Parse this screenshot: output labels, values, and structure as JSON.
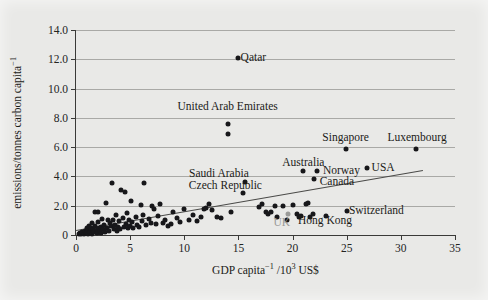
{
  "chart_data": {
    "type": "scatter",
    "title": "",
    "xlabel": "GDP capita⁻¹ /10³ US$",
    "ylabel": "emissions/tonnes carbon capita⁻¹",
    "xlim": [
      0,
      35
    ],
    "ylim": [
      0,
      14
    ],
    "xticks": [
      0,
      5,
      10,
      15,
      20,
      25,
      30,
      35
    ],
    "xtick_labels": [
      "0",
      "5",
      "10",
      "15",
      "20",
      "25",
      "30",
      "35"
    ],
    "yticks": [
      0,
      2,
      4,
      6,
      8,
      10,
      12,
      14
    ],
    "ytick_labels": [
      "0",
      "2.0",
      "4.0",
      "6.0",
      "8.0",
      "10.0",
      "12.0",
      "14.0"
    ],
    "grid": "horizontal",
    "legend": "none",
    "point_color": "#17171a",
    "highlight_color": "#9a9a98",
    "trendline": {
      "x": [
        0,
        32
      ],
      "y": [
        0.35,
        4.45
      ],
      "color": "#4a4a48"
    },
    "annotations": [
      {
        "label": "Qatar",
        "x": 15.2,
        "y": 12.1,
        "anchor": "left"
      },
      {
        "label": "United Arab Emirates",
        "x": 14.0,
        "y": 8.75,
        "anchor": "center"
      },
      {
        "label": "Singapore",
        "x": 24.9,
        "y": 6.6,
        "anchor": "center"
      },
      {
        "label": "Luxembourg",
        "x": 31.5,
        "y": 6.65,
        "anchor": "center"
      },
      {
        "label": "Australia",
        "x": 21.0,
        "y": 4.95,
        "anchor": "center"
      },
      {
        "label": "Norway",
        "x": 22.8,
        "y": 4.35,
        "anchor": "left"
      },
      {
        "label": "USA",
        "x": 27.3,
        "y": 4.6,
        "anchor": "left"
      },
      {
        "label": "Saudi Arabia",
        "x": 13.2,
        "y": 4.15,
        "anchor": "center"
      },
      {
        "label": "Canada",
        "x": 22.5,
        "y": 3.6,
        "anchor": "left"
      },
      {
        "label": "Czech Republic",
        "x": 13.8,
        "y": 3.35,
        "anchor": "center"
      },
      {
        "label": "Switzerland",
        "x": 25.2,
        "y": 1.65,
        "anchor": "left"
      },
      {
        "label": "Hong Kong",
        "x": 23.0,
        "y": 0.95,
        "anchor": "center"
      },
      {
        "label": "UK",
        "x": 19.0,
        "y": 0.85,
        "anchor": "center",
        "color": "gray"
      }
    ],
    "labelled_points": [
      {
        "name": "Qatar",
        "x": 15.0,
        "y": 12.1
      },
      {
        "name": "United Arab Emirates",
        "x": 14.0,
        "y": 7.6
      },
      {
        "name": "United Arab Emirates (2)",
        "x": 14.0,
        "y": 6.9
      },
      {
        "name": "Singapore",
        "x": 24.9,
        "y": 5.85
      },
      {
        "name": "Luxembourg",
        "x": 31.4,
        "y": 5.85
      },
      {
        "name": "USA",
        "x": 26.9,
        "y": 4.6
      },
      {
        "name": "Australia",
        "x": 21.0,
        "y": 4.35
      },
      {
        "name": "Norway",
        "x": 22.3,
        "y": 4.35
      },
      {
        "name": "Canada",
        "x": 22.0,
        "y": 3.85
      },
      {
        "name": "Saudi Arabia",
        "x": 15.6,
        "y": 3.6
      },
      {
        "name": "Czech Republic",
        "x": 15.4,
        "y": 2.9
      },
      {
        "name": "Switzerland",
        "x": 25.0,
        "y": 1.65
      },
      {
        "name": "Hong Kong",
        "x": 23.1,
        "y": 1.3
      },
      {
        "name": "UK",
        "x": 19.6,
        "y": 1.45
      }
    ],
    "points": [
      {
        "x": 0.25,
        "y": 0.08
      },
      {
        "x": 0.4,
        "y": 0.12
      },
      {
        "x": 0.5,
        "y": 0.05
      },
      {
        "x": 0.6,
        "y": 0.2
      },
      {
        "x": 0.7,
        "y": 0.1
      },
      {
        "x": 0.8,
        "y": 0.3
      },
      {
        "x": 0.9,
        "y": 0.15
      },
      {
        "x": 1.0,
        "y": 0.45
      },
      {
        "x": 1.05,
        "y": 0.22
      },
      {
        "x": 1.1,
        "y": 0.07
      },
      {
        "x": 1.2,
        "y": 0.6
      },
      {
        "x": 1.25,
        "y": 0.35
      },
      {
        "x": 1.3,
        "y": 0.18
      },
      {
        "x": 1.4,
        "y": 0.5
      },
      {
        "x": 1.45,
        "y": 0.1
      },
      {
        "x": 1.5,
        "y": 0.8
      },
      {
        "x": 1.55,
        "y": 0.3
      },
      {
        "x": 1.6,
        "y": 0.42
      },
      {
        "x": 1.7,
        "y": 0.2
      },
      {
        "x": 1.75,
        "y": 1.6
      },
      {
        "x": 1.8,
        "y": 0.6
      },
      {
        "x": 1.9,
        "y": 0.35
      },
      {
        "x": 1.95,
        "y": 0.12
      },
      {
        "x": 2.0,
        "y": 1.55
      },
      {
        "x": 2.05,
        "y": 0.9
      },
      {
        "x": 2.1,
        "y": 0.45
      },
      {
        "x": 2.2,
        "y": 0.25
      },
      {
        "x": 2.3,
        "y": 0.55
      },
      {
        "x": 2.35,
        "y": 0.15
      },
      {
        "x": 2.4,
        "y": 1.1
      },
      {
        "x": 2.5,
        "y": 0.4
      },
      {
        "x": 2.6,
        "y": 0.7
      },
      {
        "x": 2.7,
        "y": 0.22
      },
      {
        "x": 2.8,
        "y": 2.2
      },
      {
        "x": 2.9,
        "y": 0.5
      },
      {
        "x": 3.0,
        "y": 1.05
      },
      {
        "x": 3.05,
        "y": 0.3
      },
      {
        "x": 3.1,
        "y": 0.85
      },
      {
        "x": 3.2,
        "y": 0.6
      },
      {
        "x": 3.3,
        "y": 3.55
      },
      {
        "x": 3.4,
        "y": 1.0
      },
      {
        "x": 3.5,
        "y": 0.42
      },
      {
        "x": 3.6,
        "y": 0.65
      },
      {
        "x": 3.7,
        "y": 1.35
      },
      {
        "x": 3.8,
        "y": 0.3
      },
      {
        "x": 3.9,
        "y": 0.55
      },
      {
        "x": 4.0,
        "y": 0.95
      },
      {
        "x": 4.1,
        "y": 0.4
      },
      {
        "x": 4.2,
        "y": 3.05
      },
      {
        "x": 4.3,
        "y": 1.15
      },
      {
        "x": 4.4,
        "y": 0.58
      },
      {
        "x": 4.5,
        "y": 2.95
      },
      {
        "x": 4.6,
        "y": 0.75
      },
      {
        "x": 4.7,
        "y": 1.5
      },
      {
        "x": 4.8,
        "y": 0.45
      },
      {
        "x": 4.9,
        "y": 1.0
      },
      {
        "x": 5.0,
        "y": 0.62
      },
      {
        "x": 5.1,
        "y": 2.3
      },
      {
        "x": 5.2,
        "y": 0.9
      },
      {
        "x": 5.3,
        "y": 0.5
      },
      {
        "x": 5.5,
        "y": 1.25
      },
      {
        "x": 5.6,
        "y": 0.7
      },
      {
        "x": 5.8,
        "y": 0.55
      },
      {
        "x": 6.0,
        "y": 2.05
      },
      {
        "x": 6.1,
        "y": 0.95
      },
      {
        "x": 6.2,
        "y": 1.4
      },
      {
        "x": 6.3,
        "y": 3.55
      },
      {
        "x": 6.5,
        "y": 0.65
      },
      {
        "x": 6.7,
        "y": 1.1
      },
      {
        "x": 6.9,
        "y": 0.85
      },
      {
        "x": 7.0,
        "y": 2.0
      },
      {
        "x": 7.2,
        "y": 1.75
      },
      {
        "x": 7.4,
        "y": 0.72
      },
      {
        "x": 7.6,
        "y": 1.3
      },
      {
        "x": 7.8,
        "y": 2.1
      },
      {
        "x": 8.0,
        "y": 0.8
      },
      {
        "x": 8.2,
        "y": 1.0
      },
      {
        "x": 8.5,
        "y": 0.6
      },
      {
        "x": 8.8,
        "y": 0.78
      },
      {
        "x": 9.0,
        "y": 1.6
      },
      {
        "x": 9.3,
        "y": 1.15
      },
      {
        "x": 9.6,
        "y": 0.9
      },
      {
        "x": 10.0,
        "y": 1.75
      },
      {
        "x": 10.4,
        "y": 1.05
      },
      {
        "x": 10.8,
        "y": 1.4
      },
      {
        "x": 11.2,
        "y": 0.95
      },
      {
        "x": 11.5,
        "y": 1.2
      },
      {
        "x": 11.8,
        "y": 1.75
      },
      {
        "x": 12.0,
        "y": 1.85
      },
      {
        "x": 12.3,
        "y": 2.15
      },
      {
        "x": 12.6,
        "y": 1.7
      },
      {
        "x": 13.0,
        "y": 1.2
      },
      {
        "x": 13.4,
        "y": 1.15
      },
      {
        "x": 14.3,
        "y": 1.6
      },
      {
        "x": 16.9,
        "y": 1.9
      },
      {
        "x": 17.2,
        "y": 2.15
      },
      {
        "x": 17.5,
        "y": 1.6
      },
      {
        "x": 17.7,
        "y": 1.45
      },
      {
        "x": 18.0,
        "y": 1.55
      },
      {
        "x": 18.4,
        "y": 1.95
      },
      {
        "x": 18.6,
        "y": 1.2
      },
      {
        "x": 19.1,
        "y": 1.95
      },
      {
        "x": 19.5,
        "y": 1.05
      },
      {
        "x": 20.0,
        "y": 2.05
      },
      {
        "x": 20.4,
        "y": 1.45
      },
      {
        "x": 20.6,
        "y": 1.2
      },
      {
        "x": 20.8,
        "y": 1.3
      },
      {
        "x": 21.2,
        "y": 2.1
      },
      {
        "x": 21.4,
        "y": 2.2
      },
      {
        "x": 21.6,
        "y": 1.25
      },
      {
        "x": 21.9,
        "y": 1.45
      }
    ]
  }
}
